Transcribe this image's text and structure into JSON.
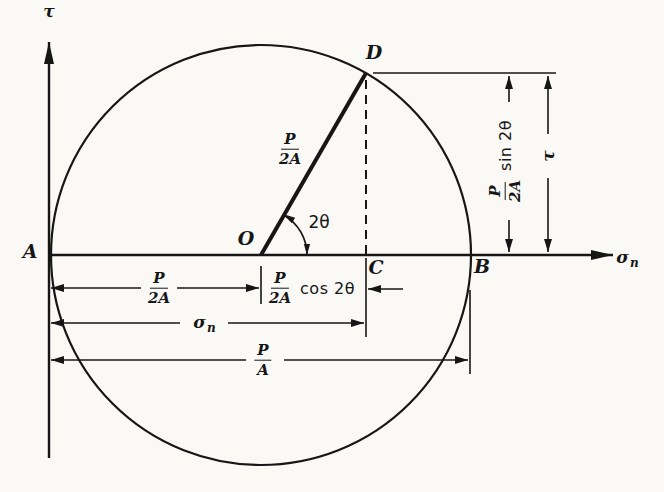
{
  "diagram": {
    "colors": {
      "ink": "#161616",
      "paper": "#faf9f6"
    },
    "axes": {
      "vertical": {
        "label": "τ"
      },
      "horizontal": {
        "label_base": "σ",
        "label_sub": "n"
      }
    },
    "points": {
      "A": "A",
      "B": "B",
      "C": "C",
      "D": "D",
      "O": "O"
    },
    "radius_label": {
      "num": "P",
      "den": "2A"
    },
    "angle_label": "2θ",
    "dims": {
      "row1_left": {
        "num": "P",
        "den": "2A"
      },
      "row1_right": {
        "num": "P",
        "den": "2A",
        "fn": "cos 2θ"
      },
      "row2": {
        "base": "σ",
        "sub": "n"
      },
      "row3": {
        "num": "P",
        "den": "A"
      },
      "vert1": {
        "num": "P",
        "den": "2A",
        "fn": "sin 2θ"
      },
      "vert2": {
        "label": "τ"
      }
    }
  }
}
